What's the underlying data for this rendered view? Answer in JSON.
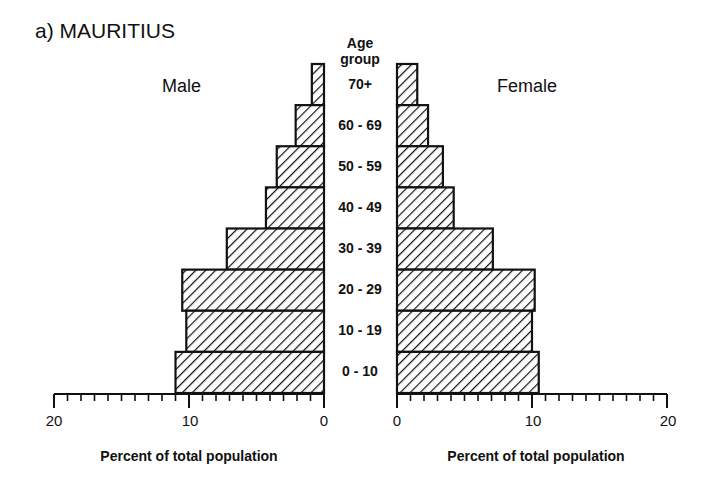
{
  "title": "a) MAURITIUS",
  "labels": {
    "male": "Male",
    "female": "Female",
    "age_header_line1": "Age",
    "age_header_line2": "group",
    "x_axis_title_left": "Percent of total population",
    "x_axis_title_right": "Percent of total population"
  },
  "ticks": {
    "left": [
      "20",
      "10",
      "0"
    ],
    "right": [
      "0",
      "10",
      "20"
    ]
  },
  "colors": {
    "ink": "#111111",
    "background": "#ffffff"
  },
  "chart_data": {
    "type": "bar",
    "subtype": "population-pyramid",
    "title": "a) MAURITIUS",
    "categories": [
      "70+",
      "60 - 69",
      "50 - 59",
      "40 - 49",
      "30 - 39",
      "20 - 29",
      "10 - 19",
      "0 - 10"
    ],
    "series": [
      {
        "name": "Male",
        "values": [
          0.9,
          2.1,
          3.5,
          4.3,
          7.2,
          10.5,
          10.2,
          11.0
        ]
      },
      {
        "name": "Female",
        "values": [
          1.5,
          2.3,
          3.4,
          4.2,
          7.1,
          10.2,
          10.0,
          10.5
        ]
      }
    ],
    "xlabel": "Percent of total population",
    "ylabel": "Age group",
    "xlim": [
      0,
      20
    ],
    "minor_tick_step": 1,
    "major_tick_step": 10,
    "grid": false,
    "fill": "diagonal hatch"
  }
}
